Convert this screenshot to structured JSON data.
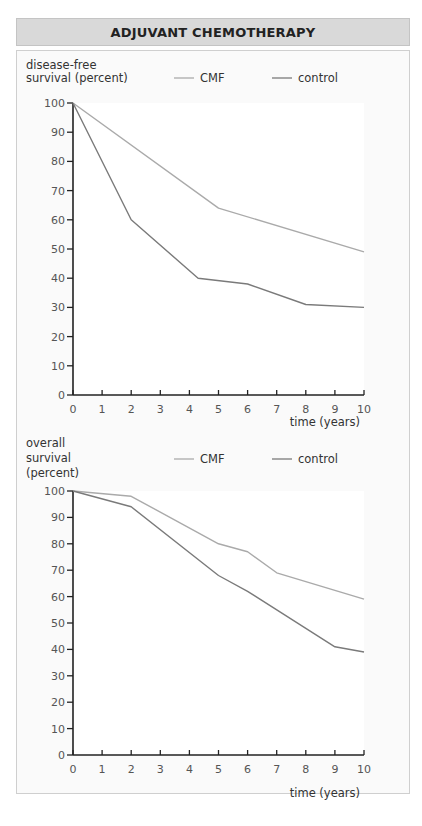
{
  "title": "ADJUVANT CHEMOTHERAPY",
  "colors": {
    "cmf": "#aaaaaa",
    "control": "#7a7a7a",
    "axis": "#222222",
    "header_bg": "#d9d9d9"
  },
  "legend": {
    "cmf_label": "CMF",
    "control_label": "control"
  },
  "charts": [
    {
      "ylabel_lines": [
        "disease-free",
        "survival (percent)"
      ],
      "xlabel": "time (years)"
    },
    {
      "ylabel_lines": [
        "overall",
        "survival",
        "(percent)"
      ],
      "xlabel": "time (years)"
    }
  ],
  "chart_data": [
    {
      "type": "line",
      "title": "disease-free survival",
      "xlabel": "time (years)",
      "ylabel": "disease-free survival (percent)",
      "xlim": [
        0,
        10
      ],
      "ylim": [
        0,
        100
      ],
      "xticks": [
        0,
        1,
        2,
        3,
        4,
        5,
        6,
        7,
        8,
        9,
        10
      ],
      "yticks": [
        0,
        10,
        20,
        30,
        40,
        50,
        60,
        70,
        80,
        90,
        100
      ],
      "grid": false,
      "legend_position": "top",
      "series": [
        {
          "name": "CMF",
          "x": [
            0,
            5,
            10
          ],
          "y": [
            100,
            64,
            49
          ]
        },
        {
          "name": "control",
          "x": [
            0,
            2,
            4.3,
            6,
            8,
            10
          ],
          "y": [
            100,
            60,
            40,
            38,
            31,
            30
          ]
        }
      ]
    },
    {
      "type": "line",
      "title": "overall survival",
      "xlabel": "time (years)",
      "ylabel": "overall survival (percent)",
      "xlim": [
        0,
        10
      ],
      "ylim": [
        0,
        100
      ],
      "xticks": [
        0,
        1,
        2,
        3,
        4,
        5,
        6,
        7,
        8,
        9,
        10
      ],
      "yticks": [
        0,
        10,
        20,
        30,
        40,
        50,
        60,
        70,
        80,
        90,
        100
      ],
      "grid": false,
      "legend_position": "top",
      "series": [
        {
          "name": "CMF",
          "x": [
            0,
            2,
            5,
            6,
            7,
            10
          ],
          "y": [
            100,
            98,
            80,
            77,
            69,
            59
          ]
        },
        {
          "name": "control",
          "x": [
            0,
            2,
            5,
            6,
            9,
            10
          ],
          "y": [
            100,
            94,
            68,
            62,
            41,
            39
          ]
        }
      ]
    }
  ]
}
